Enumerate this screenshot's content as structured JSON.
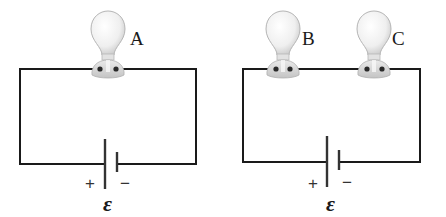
{
  "diagram": {
    "type": "circuit-comparison",
    "colors": {
      "wire": "#1a1a1a",
      "bulb_glass": "#eeeeee",
      "bulb_outline": "#b5b5b5",
      "socket": "#d6d6d6",
      "terminal": "#2a2a2a"
    },
    "circuits": [
      {
        "id": "circuit-1",
        "bulbs": [
          {
            "label": "A"
          }
        ],
        "battery": {
          "plus": "+",
          "minus": "−",
          "emf_symbol": "ε"
        }
      },
      {
        "id": "circuit-2",
        "bulbs": [
          {
            "label": "B"
          },
          {
            "label": "C"
          }
        ],
        "battery": {
          "plus": "+",
          "minus": "−",
          "emf_symbol": "ε"
        }
      }
    ]
  }
}
